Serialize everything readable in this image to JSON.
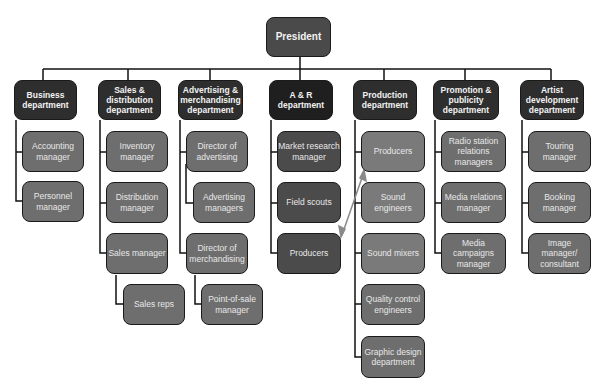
{
  "president": {
    "label": "President"
  },
  "departments": [
    {
      "label": "Business department",
      "items": [
        "Accounting manager",
        "Personnel manager"
      ]
    },
    {
      "label": "Sales & distribution department",
      "items": [
        "Inventory manager",
        "Distribution manager",
        "Sales manager",
        "Sales reps"
      ]
    },
    {
      "label": "Advertising & merchandising department",
      "items": [
        "Director of advertising",
        "Advertising managers",
        "Director of merchandising",
        "Point-of-sale manager"
      ]
    },
    {
      "label": "A & R department",
      "items": [
        "Market research manager",
        "Field scouts",
        "Producers"
      ]
    },
    {
      "label": "Production department",
      "items": [
        "Producers",
        "Sound engineers",
        "Sound mixers",
        "Quality control engineers",
        "Graphic design department"
      ]
    },
    {
      "label": "Promotion & publicity department",
      "items": [
        "Radio station relations managers",
        "Media relations manager",
        "Media campaigns manager"
      ]
    },
    {
      "label": "Artist development department",
      "items": [
        "Touring manager",
        "Booking manager",
        "Image manager/ consultant"
      ]
    }
  ],
  "colors": {
    "head": "#2e2e2e",
    "sub": "#6e6e6e",
    "ar_sub": "#4b4b4b",
    "line": "#111111",
    "arrow": "#8a8a8a"
  }
}
